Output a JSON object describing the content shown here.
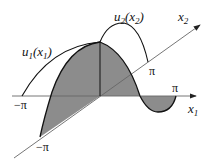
{
  "diagram": {
    "axes": {
      "x1": {
        "label": "x",
        "subscript": "1",
        "min_label": "−π",
        "max_label": "π"
      },
      "x2": {
        "label": "x",
        "subscript": "2",
        "min_label": "−π",
        "max_label": "π"
      }
    },
    "curves": {
      "u1": {
        "label_main": "u",
        "label_sub": "1",
        "label_arg": "(x",
        "label_arg_sub": "1",
        "label_close": ")"
      },
      "u2": {
        "label_main": "u",
        "label_sub": "2",
        "label_arg": "(x",
        "label_arg_sub": "2",
        "label_close": ")"
      }
    },
    "colors": {
      "shade": "#8c8c8c",
      "line": "#111111",
      "axis": "#555555"
    }
  }
}
